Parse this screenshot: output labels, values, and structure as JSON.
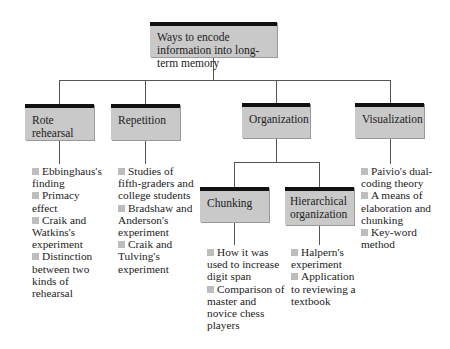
{
  "root": {
    "label": "Ways to encode information into long-term memory"
  },
  "categories": [
    {
      "label": "Rote rehearsal",
      "items": [
        "Ebbinghaus's finding",
        "Primacy effect",
        "Craik and Watkins's experiment",
        "Distinction between two kinds of rehearsal"
      ]
    },
    {
      "label": "Repetition",
      "items": [
        "Studies of fifth-graders and college students",
        "Bradshaw and Anderson's experiment",
        "Craik and Tulving's experiment"
      ]
    },
    {
      "label": "Organization",
      "children": [
        {
          "label": "Chunking",
          "items": [
            "How it was used to increase digit span",
            "Comparison of master and novice chess players"
          ]
        },
        {
          "label": "Hierarchical organization",
          "items": [
            "Halpern's experiment",
            "Application to reviewing a textbook"
          ]
        }
      ]
    },
    {
      "label": "Visualization",
      "items": [
        "Paivio's dual-coding theory",
        "A means of elaboration and chunking",
        "Key-word method"
      ]
    }
  ],
  "colors": {
    "box_fill": "#c9c9c9",
    "box_top_border": "#111111",
    "bullet": "#bdbdbd",
    "connector": "#555555"
  }
}
